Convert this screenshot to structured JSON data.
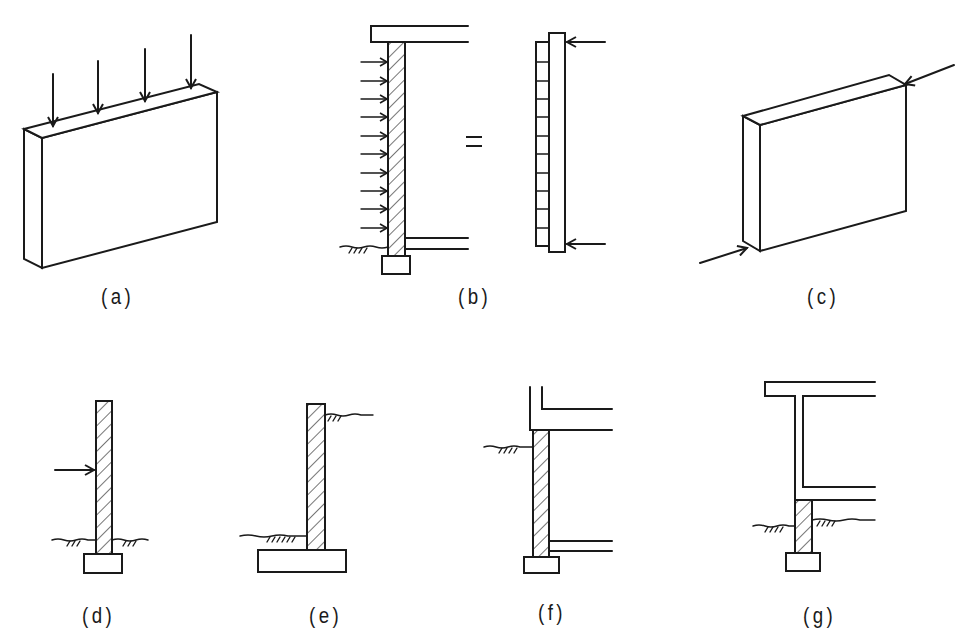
{
  "figure": {
    "panels": [
      {
        "id": "a",
        "label": "(a)",
        "description": "Wall panel with vertical downward loads (4 arrows) on top edge"
      },
      {
        "id": "b",
        "label": "(b)",
        "description": "Basement wall with lateral soil pressure between floor slab and base slab, equals simply supported beam with uniform load and reactions",
        "equals_sign": "="
      },
      {
        "id": "c",
        "label": "(c)",
        "description": "Wall panel loaded in-plane by diagonal forces at corners"
      },
      {
        "id": "d",
        "label": "(d)",
        "description": "Cantilever wall with concentrated lateral load on footing"
      },
      {
        "id": "e",
        "label": "(e)",
        "description": "Cantilever retaining wall with spread footing, soil higher on right"
      },
      {
        "id": "f",
        "label": "(f)",
        "description": "Basement wall supporting floor slab, soil on left"
      },
      {
        "id": "g",
        "label": "(g)",
        "description": "Short wall under frame column/slab, soil both sides"
      }
    ]
  },
  "colors": {
    "line": "#1a1a1a",
    "background": "#ffffff"
  }
}
